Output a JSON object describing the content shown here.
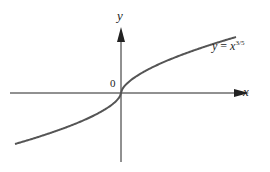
{
  "chart_data": {
    "type": "line",
    "title": "",
    "function": "y = x^(3/5)",
    "curve_label": {
      "lhs": "y",
      "eq": "=",
      "base": "x",
      "exponent": "3/5"
    },
    "xlabel": "x",
    "ylabel": "y",
    "origin_label": "0",
    "x_range": [
      -1,
      1
    ],
    "y_range": [
      -1,
      1
    ],
    "grid": false,
    "legend": "none",
    "curve_color": "#555555",
    "axis_color": "#222222"
  }
}
